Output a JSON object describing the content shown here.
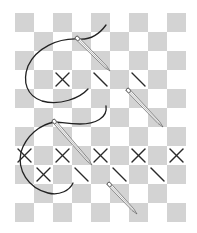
{
  "title": "Cross stitch illustration",
  "grid": {
    "origin_x": 15,
    "origin_y": 13,
    "cell": 19,
    "cols": 9,
    "rows": 11,
    "shade_color": "#d3d3d3",
    "background": "#ffffff"
  },
  "stitches": {
    "color": "#2a2a2a",
    "crosses": [
      {
        "row": 4,
        "col": 3
      },
      {
        "row": 8,
        "col": 1
      },
      {
        "row": 8,
        "col": 3
      },
      {
        "row": 8,
        "col": 5
      },
      {
        "row": 8,
        "col": 7
      },
      {
        "row": 8,
        "col": 9
      },
      {
        "row": 9,
        "col": 2
      }
    ],
    "half_stitches": [
      {
        "row": 4,
        "col": 5
      },
      {
        "row": 4,
        "col": 7
      },
      {
        "row": 9,
        "col": 4
      },
      {
        "row": 9,
        "col": 6
      },
      {
        "row": 9,
        "col": 8
      }
    ]
  },
  "needles": [
    {
      "name": "needle-1",
      "eye": [
        76,
        37
      ],
      "tip": [
        110,
        71
      ]
    },
    {
      "name": "needle-2",
      "eye": [
        127,
        89
      ],
      "tip": [
        163,
        127
      ]
    },
    {
      "name": "needle-3",
      "eye": [
        53,
        120
      ],
      "tip": [
        92,
        165
      ]
    },
    {
      "name": "needle-4",
      "eye": [
        108,
        183
      ],
      "tip": [
        137,
        214
      ]
    }
  ],
  "threads": {
    "color": "#222222",
    "paths": [
      "M106,25 C98,36 88,40 78,39 C58,38 36,48 28,66 C22,82 27,96 42,101 C60,106 80,98 88,89",
      "M106,106 C108,118 95,124 80,124 C68,124 60,122 55,122 C40,124 26,136 21,152 C17,170 28,188 48,193 C60,196 70,190 73,183"
    ]
  },
  "caption": ""
}
